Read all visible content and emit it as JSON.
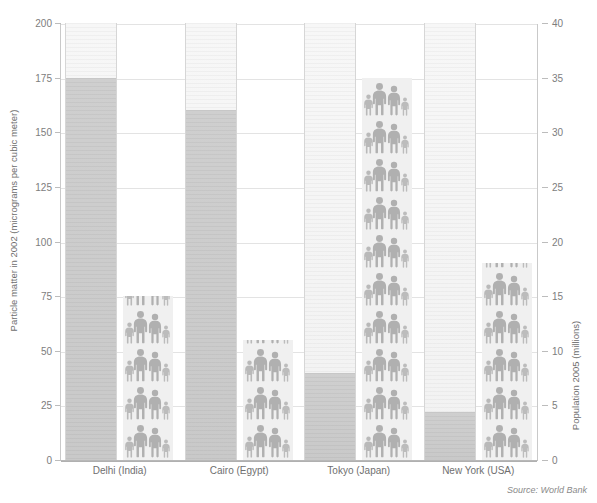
{
  "chart_data": {
    "type": "bar",
    "title": "",
    "subtitle": "",
    "categories": [
      "Delhi (India)",
      "Cairo (Egypt)",
      "Tokyo (Japan)",
      "New York (USA)"
    ],
    "series": [
      {
        "name": "Particle matter in 2002 (micrograms per cubic meter)",
        "axis": "left",
        "unit": "micrograms per cubic meter",
        "values": [
          175,
          160,
          40,
          22
        ]
      },
      {
        "name": "Population 2005 (millions)",
        "axis": "right",
        "unit": "millions",
        "values": [
          15,
          11,
          35,
          18
        ]
      }
    ],
    "xlabel": "",
    "ylabel": "Particle matter in 2002 (micrograms per cubic meter)",
    "y2label": "Population 2005 (millions)",
    "ylim": [
      0,
      200
    ],
    "y2lim": [
      0,
      40
    ],
    "yticks": [
      0,
      25,
      50,
      75,
      100,
      125,
      150,
      175,
      200
    ],
    "y2ticks": [
      0,
      5,
      10,
      15,
      20,
      25,
      30,
      35,
      40
    ],
    "grid": true,
    "legend": "none",
    "annotations": [
      "Source: World Bank"
    ]
  },
  "axes": {
    "left": {
      "title": "Particle matter in 2002 (micrograms per cubic meter)",
      "ticks": [
        "0",
        "25",
        "50",
        "75",
        "100",
        "125",
        "150",
        "175",
        "200"
      ]
    },
    "right": {
      "title": "Population 2005 (millions)",
      "ticks": [
        "0",
        "5",
        "10",
        "15",
        "20",
        "25",
        "30",
        "35",
        "40"
      ]
    }
  },
  "categories": [
    {
      "label": "Delhi (India)",
      "pm": 175,
      "pop": 15
    },
    {
      "label": "Cairo (Egypt)",
      "pm": 160,
      "pop": 11
    },
    {
      "label": "Tokyo (Japan)",
      "pm": 40,
      "pop": 35
    },
    {
      "label": "New York (USA)",
      "pm": 22,
      "pop": 18
    }
  ],
  "source": {
    "text": "Source: World Bank"
  },
  "colors": {
    "background": "#ffffff",
    "grid": "#e3e3e3",
    "tube_empty": "#f4f4f4",
    "tube_fill": "#cccccc",
    "pictogram": "#b3b3b3",
    "pictogram_bg": "#f0f0f0",
    "text": "#7a7a7a"
  }
}
